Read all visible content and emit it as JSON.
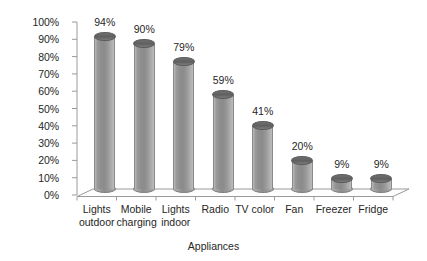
{
  "chart_data": {
    "type": "bar",
    "title": "",
    "subtitle": "",
    "xlabel": "Appliances",
    "ylabel": "",
    "categories": [
      "Lights outdoor",
      "Mobile charging",
      "Lights indoor",
      "Radio",
      "TV color",
      "Fan",
      "Freezer",
      "Fridge"
    ],
    "category_lines": [
      "Lights\noutdoor",
      "Mobile\ncharging",
      "Lights\nindoor",
      "Radio",
      "TV color",
      "Fan",
      "Freezer",
      "Fridge"
    ],
    "values": [
      94,
      90,
      79,
      59,
      41,
      20,
      9,
      9
    ],
    "data_labels": [
      "94%",
      "90%",
      "79%",
      "59%",
      "41%",
      "20%",
      "9%",
      "9%"
    ],
    "ylim": [
      0,
      100
    ],
    "ytick_labels": [
      "100%",
      "90%",
      "80%",
      "70%",
      "60%",
      "50%",
      "40%",
      "30%",
      "20%",
      "10%",
      "0%"
    ],
    "ytick_values": [
      100,
      90,
      80,
      70,
      60,
      50,
      40,
      30,
      20,
      10,
      0
    ],
    "grid": false,
    "legend": false,
    "legend_position": "none",
    "style": "3d-cylinder",
    "series_color": "#8e8e8e",
    "axis_color": "#808080",
    "text_color": "#262626",
    "background": "#ffffff"
  }
}
